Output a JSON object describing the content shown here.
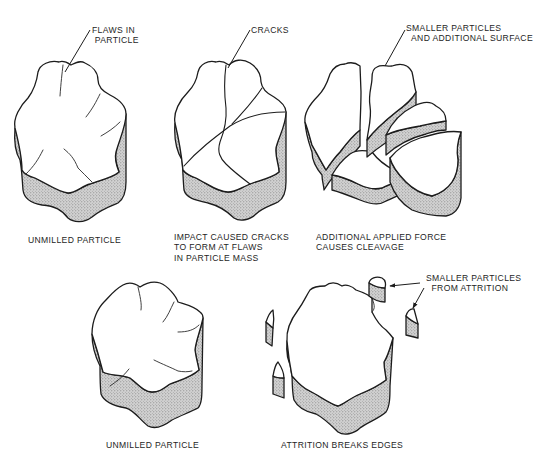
{
  "figure": {
    "type": "particle milling mechanisms illustration",
    "colors": {
      "line": "#1c1c1c",
      "stipple_fill": "#bdbdbd",
      "background": "#ffffff",
      "text": "#1e1e1e"
    },
    "panels": [
      {
        "id": "unmilled-particle-top",
        "callout": "FLAWS IN\n PARTICLE",
        "caption": "UNMILLED PARTICLE"
      },
      {
        "id": "impact-cracks",
        "callout": "CRACKS",
        "caption": "IMPACT CAUSED CRACKS\nTO FORM AT FLAWS\nIN PARTICLE MASS"
      },
      {
        "id": "cleavage",
        "callout": "SMALLER PARTICLES\n  AND ADDITIONAL SURFACE",
        "caption": "ADDITIONAL APPLIED FORCE\nCAUSES CLEAVAGE"
      },
      {
        "id": "unmilled-particle-bottom",
        "callout": "",
        "caption": "UNMILLED PARTICLE"
      },
      {
        "id": "attrition",
        "callout": "SMALLER PARTICLES\n  FROM ATTRITION",
        "caption": "ATTRITION BREAKS EDGES"
      }
    ]
  }
}
